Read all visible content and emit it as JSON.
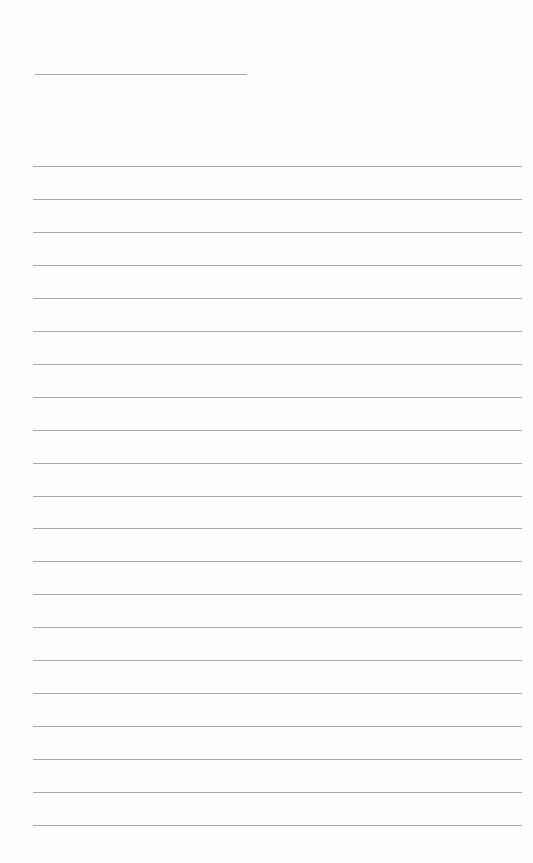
{
  "page": {
    "type": "lined-paper",
    "background": "#fefefe",
    "line_color": "#a9a9a9",
    "header_line": {
      "x": 35,
      "y": 74,
      "width": 212
    },
    "ruled_lines": {
      "count": 21,
      "start_y": 166,
      "spacing": 32.95,
      "x": 33,
      "width": 489
    }
  }
}
